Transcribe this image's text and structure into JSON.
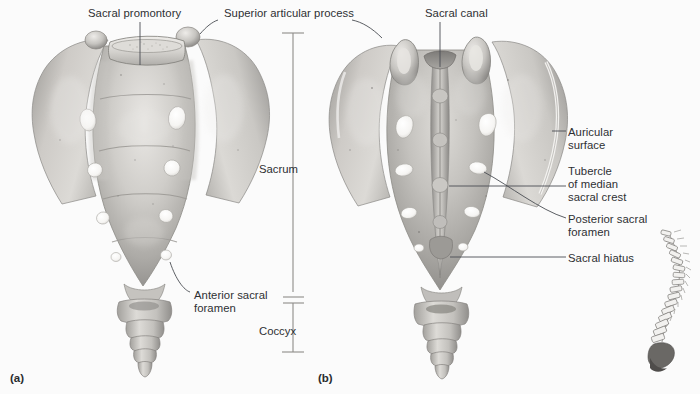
{
  "figure": {
    "title_implicit": "Sacrum and Coccyx",
    "background_color": "#fbfbfb",
    "text_color": "#2e3033",
    "leader_color": "#4a4d52",
    "bone_light": "#e6e4e1",
    "bone_mid": "#b3b1ad",
    "bone_dark": "#8b8986",
    "foramen_color": "#fdfdfc",
    "inset_bone_color": "#8d8b88",
    "inset_highlight_color": "#6a6865"
  },
  "panels": [
    {
      "id": "a",
      "label": "(a)",
      "view": "anterior",
      "x": 10,
      "y": 372
    },
    {
      "id": "b",
      "label": "(b)",
      "view": "posterior",
      "x": 318,
      "y": 372
    }
  ],
  "labels_anterior": [
    {
      "name": "sacral-promontory",
      "text": "Sacral promontory",
      "x": 88,
      "y": 7,
      "leader": "vertical-down"
    },
    {
      "name": "superior-articular-process",
      "text": "Superior articular process",
      "x": 224,
      "y": 7,
      "leader": "hook-left-and-right"
    },
    {
      "name": "anterior-sacral-foramen",
      "text": "Anterior sacral\nforamen",
      "x": 194,
      "y": 289,
      "leader": "diagonal-up-left"
    }
  ],
  "labels_posterior": [
    {
      "name": "sacral-canal",
      "text": "Sacral canal",
      "x": 425,
      "y": 7,
      "leader": "vertical-down"
    },
    {
      "name": "auricular-surface",
      "text": "Auricular\nsurface",
      "x": 568,
      "y": 126,
      "leader": "horizontal-left"
    },
    {
      "name": "tubercle-of-median-sacral-crest",
      "text": "Tubercle\nof median\nsacral crest",
      "x": 568,
      "y": 165,
      "leader": "horizontal-left"
    },
    {
      "name": "posterior-sacral-foramen",
      "text": "Posterior sacral\nforamen",
      "x": 568,
      "y": 213,
      "leader": "horizontal-left"
    },
    {
      "name": "sacral-hiatus",
      "text": "Sacral hiatus",
      "x": 568,
      "y": 252,
      "leader": "horizontal-left"
    }
  ],
  "bracket": {
    "name": "sacrum-coccyx-bracket",
    "axis_x": 293,
    "top_y": 33,
    "break_y_top": 297,
    "break_y_bottom": 303,
    "bottom_y": 352,
    "cap_half_width": 11,
    "segments": [
      {
        "name": "sacrum",
        "label": "Sacrum",
        "label_x": 259,
        "label_y": 163
      },
      {
        "name": "coccyx",
        "label": "Coccyx",
        "label_x": 259,
        "label_y": 325
      }
    ]
  },
  "inset": {
    "name": "vertebral-column-inset",
    "description": "lateral view of vertebral column with sacrum and coccyx shaded",
    "x": 648,
    "y": 228,
    "width": 44,
    "height": 140
  }
}
